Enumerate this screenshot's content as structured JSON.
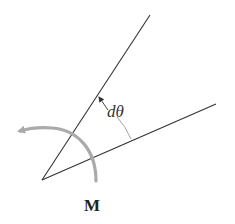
{
  "figure": {
    "labels": {
      "angle": "dθ",
      "moment": "M"
    },
    "colors": {
      "line": "#333333",
      "moment_arrow": "#aaaaaa",
      "angle_marker": "#999999",
      "background": "#ffffff"
    }
  }
}
